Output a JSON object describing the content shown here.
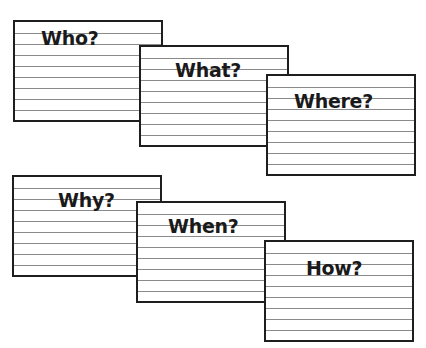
{
  "cards": [
    {
      "label": "Who?"
    },
    {
      "label": "What?"
    },
    {
      "label": "Where?"
    },
    {
      "label": "Why?"
    },
    {
      "label": "When?"
    },
    {
      "label": "How?"
    }
  ]
}
